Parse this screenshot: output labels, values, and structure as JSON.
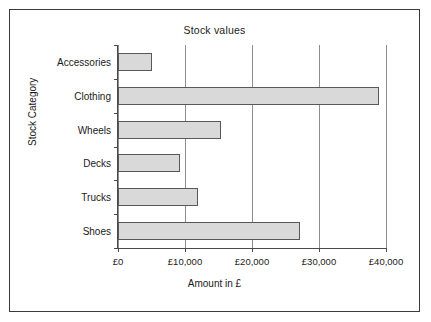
{
  "chart_data": {
    "type": "bar",
    "orientation": "horizontal",
    "title": "Stock values",
    "xlabel": "Amount in £",
    "ylabel": "Stock Category",
    "categories": [
      "Accessories",
      "Clothing",
      "Wheels",
      "Decks",
      "Trucks",
      "Shoes"
    ],
    "values": [
      5000,
      39000,
      15400,
      9300,
      12000,
      27200
    ],
    "xlim": [
      0,
      40000
    ],
    "xticks": [
      0,
      10000,
      20000,
      30000,
      40000
    ],
    "xtick_labels": [
      "£0",
      "£10,000",
      "£20,000",
      "£30,000",
      "£40,000"
    ],
    "grid": "vertical",
    "legend": "none",
    "bar_fill_color": "#d9d9d9",
    "bar_border_color": "#585858",
    "plot_background": "#ffffff",
    "frame_border_color": "#3a3a3a"
  }
}
